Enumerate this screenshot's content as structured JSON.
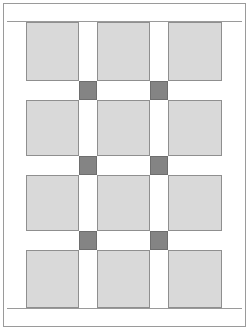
{
  "diagram": {
    "kind": "sashed-block-grid",
    "colors": {
      "block_fill": "#d9d9d9",
      "block_outline": "#8f8f8f",
      "cornerstone_fill": "#848484",
      "cornerstone_outline": "#6e6e6e",
      "sashing_fill": "#ffffff",
      "frame_outline": "#9a9a9a",
      "background": "#ffffff"
    },
    "grid": {
      "columns": 3,
      "rows": 4,
      "sashing_rows": 3,
      "sashing_columns": 2,
      "cornerstones": 6
    },
    "field": {
      "left": 26,
      "top": 22,
      "width": 196,
      "height": 286
    },
    "column_x": [
      0,
      71,
      124
    ],
    "column_w": [
      71,
      53,
      72
    ],
    "block_col_x": [
      0,
      71,
      142
    ],
    "block_col_w": [
      53,
      53,
      54
    ],
    "row_y": [
      0,
      78,
      153,
      228
    ],
    "block_row_h": [
      59,
      56,
      56,
      58
    ],
    "sashing_row_y": [
      59,
      134,
      209
    ],
    "sashing_row_h": [
      19,
      19,
      19
    ],
    "sashing_col_x": [
      53,
      124
    ],
    "sashing_col_w": [
      18,
      18
    ],
    "blocks": [
      {
        "row": 0,
        "col": 0,
        "x": 0,
        "y": 0,
        "w": 53,
        "h": 59
      },
      {
        "row": 0,
        "col": 1,
        "x": 71,
        "y": 0,
        "w": 53,
        "h": 59
      },
      {
        "row": 0,
        "col": 2,
        "x": 142,
        "y": 0,
        "w": 54,
        "h": 59
      },
      {
        "row": 1,
        "col": 0,
        "x": 0,
        "y": 78,
        "w": 53,
        "h": 56
      },
      {
        "row": 1,
        "col": 1,
        "x": 71,
        "y": 78,
        "w": 53,
        "h": 56
      },
      {
        "row": 1,
        "col": 2,
        "x": 142,
        "y": 78,
        "w": 54,
        "h": 56
      },
      {
        "row": 2,
        "col": 0,
        "x": 0,
        "y": 153,
        "w": 53,
        "h": 56
      },
      {
        "row": 2,
        "col": 1,
        "x": 71,
        "y": 153,
        "w": 53,
        "h": 56
      },
      {
        "row": 2,
        "col": 2,
        "x": 142,
        "y": 153,
        "w": 54,
        "h": 56
      },
      {
        "row": 3,
        "col": 0,
        "x": 0,
        "y": 228,
        "w": 53,
        "h": 58
      },
      {
        "row": 3,
        "col": 1,
        "x": 71,
        "y": 228,
        "w": 53,
        "h": 58
      },
      {
        "row": 3,
        "col": 2,
        "x": 142,
        "y": 228,
        "w": 54,
        "h": 58
      }
    ],
    "cornerstone_squares": [
      {
        "index": 0,
        "x": 53,
        "y": 59,
        "w": 18,
        "h": 19
      },
      {
        "index": 1,
        "x": 124,
        "y": 59,
        "w": 18,
        "h": 19
      },
      {
        "index": 2,
        "x": 53,
        "y": 134,
        "w": 18,
        "h": 19
      },
      {
        "index": 3,
        "x": 124,
        "y": 134,
        "w": 18,
        "h": 19
      },
      {
        "index": 4,
        "x": 53,
        "y": 209,
        "w": 18,
        "h": 19
      },
      {
        "index": 5,
        "x": 124,
        "y": 209,
        "w": 18,
        "h": 19
      }
    ]
  }
}
